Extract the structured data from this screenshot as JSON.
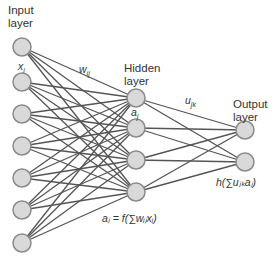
{
  "labels": {
    "input_layer": [
      "Input",
      "layer"
    ],
    "hidden_layer": [
      "Hidden",
      "layer"
    ],
    "output_layer": [
      "Output",
      "layer"
    ],
    "x_i": "x",
    "x_i_sub": "i",
    "w_ij": "w",
    "w_ij_sub": "ij",
    "a_j": "a",
    "a_j_sub": "j",
    "u_jk": "u",
    "u_jk_sub": "jk",
    "hidden_formula": "aⱼ = f(∑wᵢⱼxᵢ)",
    "output_formula": "h(∑uⱼₖaⱼ)"
  },
  "layers": {
    "input": {
      "x": 22,
      "ys": [
        47,
        82,
        114,
        146,
        178,
        210,
        243
      ]
    },
    "hidden": {
      "x": 136,
      "ys": [
        98,
        128,
        160,
        192
      ]
    },
    "output": {
      "x": 245,
      "ys": [
        130,
        162
      ]
    }
  },
  "colors": {
    "node_fill": "#d9d9d9",
    "node_stroke": "#8a8a8a",
    "edge": "#555555"
  }
}
